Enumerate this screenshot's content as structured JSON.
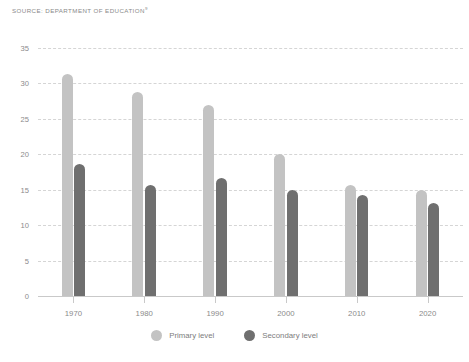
{
  "source": {
    "text": "SOURCE: DEPARTMENT OF EDUCATION",
    "superscript": "9"
  },
  "legend": {
    "items": [
      {
        "label": "Primary level",
        "color": "#c3c3c3",
        "dot": "legend-dot-primary"
      },
      {
        "label": "Secondary level",
        "color": "#6f6f6f",
        "dot": "legend-dot-secondary"
      }
    ]
  },
  "chart_data": {
    "type": "bar",
    "title": "",
    "xlabel": "",
    "ylabel": "",
    "categories": [
      "1970",
      "1980",
      "1990",
      "2000",
      "2010",
      "2020"
    ],
    "series": [
      {
        "name": "Primary level",
        "color": "#c3c3c3",
        "values": [
          31.3,
          28.8,
          26.9,
          20.0,
          15.7,
          15.0
        ]
      },
      {
        "name": "Secondary level",
        "color": "#6f6f6f",
        "values": [
          18.7,
          15.7,
          16.7,
          14.9,
          14.2,
          13.1
        ]
      }
    ],
    "ylim": [
      0,
      35
    ],
    "yticks": [
      0,
      5,
      10,
      15,
      20,
      25,
      30,
      35
    ],
    "ytick_labels": [
      "0",
      "5",
      "10",
      "15",
      "20",
      "25",
      "30",
      "35"
    ],
    "grid": true,
    "grid_style": "dashed",
    "legend_position": "bottom"
  }
}
